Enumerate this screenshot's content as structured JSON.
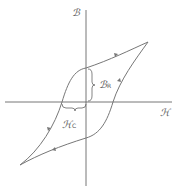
{
  "diagram": {
    "labels": {
      "b_axis": "ℬ",
      "h_axis": "ℋ",
      "remanence": {
        "symbol": "ℬ",
        "subscript": "R"
      },
      "coercivity": {
        "symbol": "ℋ",
        "subscript": "C"
      }
    },
    "colors": {
      "axis": "#666666",
      "loop": "#777777",
      "label": "#555555",
      "background": "#ffffff"
    }
  }
}
